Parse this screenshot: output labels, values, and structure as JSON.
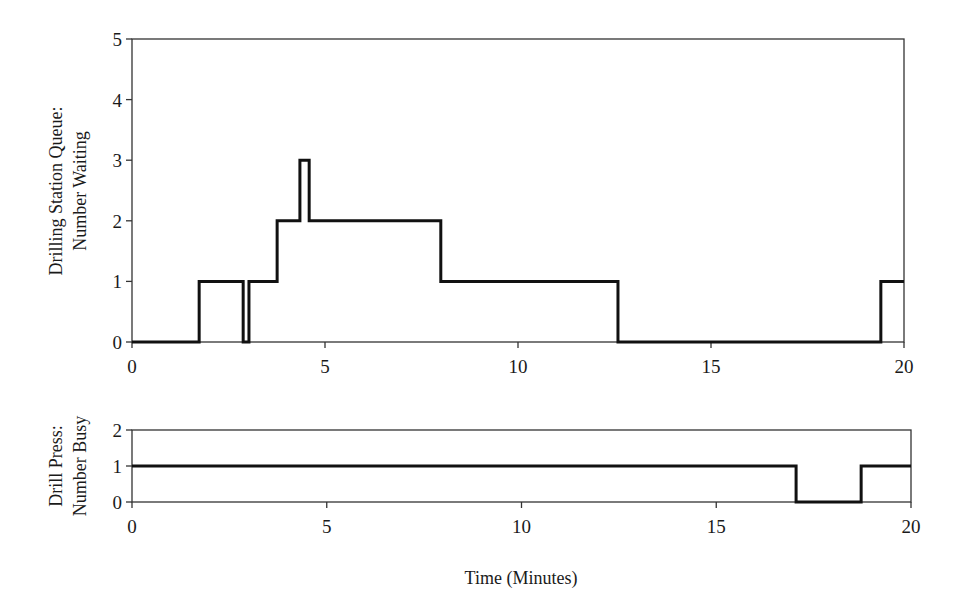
{
  "chart_data": [
    {
      "type": "line",
      "step": "post",
      "title": "",
      "xlabel": "",
      "ylabel": "Drilling Station Queue: Number Waiting",
      "ylabel_lines": [
        "Drilling Station Queue:",
        "Number Waiting"
      ],
      "xlim": [
        0,
        20
      ],
      "ylim": [
        0,
        5
      ],
      "xticks": [
        0,
        5,
        10,
        15,
        20
      ],
      "yticks": [
        0,
        1,
        2,
        3,
        4,
        5
      ],
      "grid": false,
      "legend": null,
      "series": [
        {
          "name": "Number Waiting",
          "x": [
            0,
            1.74,
            2.88,
            3.03,
            3.76,
            4.35,
            4.59,
            8.0,
            12.59,
            19.4,
            20
          ],
          "y": [
            0,
            1,
            0,
            1,
            2,
            3,
            2,
            1,
            0,
            1,
            1
          ]
        }
      ],
      "frame": {
        "left": 132,
        "top": 39,
        "right": 904,
        "bottom": 342
      }
    },
    {
      "type": "line",
      "step": "post",
      "title": "",
      "xlabel": "Time (Minutes)",
      "ylabel": "Drill Press: Number Busy",
      "ylabel_lines": [
        "Drill Press:",
        "Number Busy"
      ],
      "xlim": [
        0,
        20
      ],
      "ylim": [
        0,
        2
      ],
      "xticks": [
        0,
        5,
        10,
        15,
        20
      ],
      "yticks": [
        0,
        1,
        2
      ],
      "grid": false,
      "legend": null,
      "series": [
        {
          "name": "Number Busy",
          "x": [
            0,
            17.05,
            18.72,
            20
          ],
          "y": [
            1,
            0,
            1,
            1
          ]
        }
      ],
      "frame": {
        "left": 132,
        "top": 430,
        "right": 911,
        "bottom": 502
      }
    }
  ],
  "labels": {
    "top_ylabel_line1": "Drilling Station Queue:",
    "top_ylabel_line2": "Number Waiting",
    "bottom_ylabel_line1": "Drill Press:",
    "bottom_ylabel_line2": "Number Busy",
    "xlabel": "Time (Minutes)"
  },
  "colors": {
    "line": "#111111",
    "axis": "#333333",
    "background": "#ffffff"
  }
}
